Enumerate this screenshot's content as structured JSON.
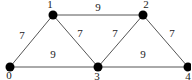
{
  "graph": {
    "nodes": [
      {
        "id": "0",
        "label": "0",
        "x": 10,
        "y": 67,
        "lx": 9,
        "ly": 79
      },
      {
        "id": "1",
        "label": "1",
        "x": 53,
        "y": 15,
        "lx": 50,
        "ly": 8
      },
      {
        "id": "2",
        "label": "2",
        "x": 143,
        "y": 15,
        "lx": 146,
        "ly": 8
      },
      {
        "id": "3",
        "label": "3",
        "x": 98,
        "y": 67,
        "lx": 97,
        "ly": 80
      },
      {
        "id": "4",
        "label": "4",
        "x": 188,
        "y": 67,
        "lx": 188,
        "ly": 80
      }
    ],
    "edges": [
      {
        "from": "0",
        "to": "1",
        "weight": "7",
        "lx": 22,
        "ly": 39
      },
      {
        "from": "1",
        "to": "2",
        "weight": "9",
        "lx": 98,
        "ly": 11
      },
      {
        "from": "1",
        "to": "3",
        "weight": "7",
        "lx": 80,
        "ly": 37
      },
      {
        "from": "0",
        "to": "3",
        "weight": "9",
        "lx": 53,
        "ly": 58
      },
      {
        "from": "2",
        "to": "3",
        "weight": "7",
        "lx": 115,
        "ly": 37
      },
      {
        "from": "2",
        "to": "4",
        "weight": "7",
        "lx": 172,
        "ly": 37
      },
      {
        "from": "3",
        "to": "4",
        "weight": "9",
        "lx": 143,
        "ly": 58
      }
    ],
    "colors": {
      "edge": "#555555",
      "node": "#000000",
      "text": "#222222"
    }
  }
}
